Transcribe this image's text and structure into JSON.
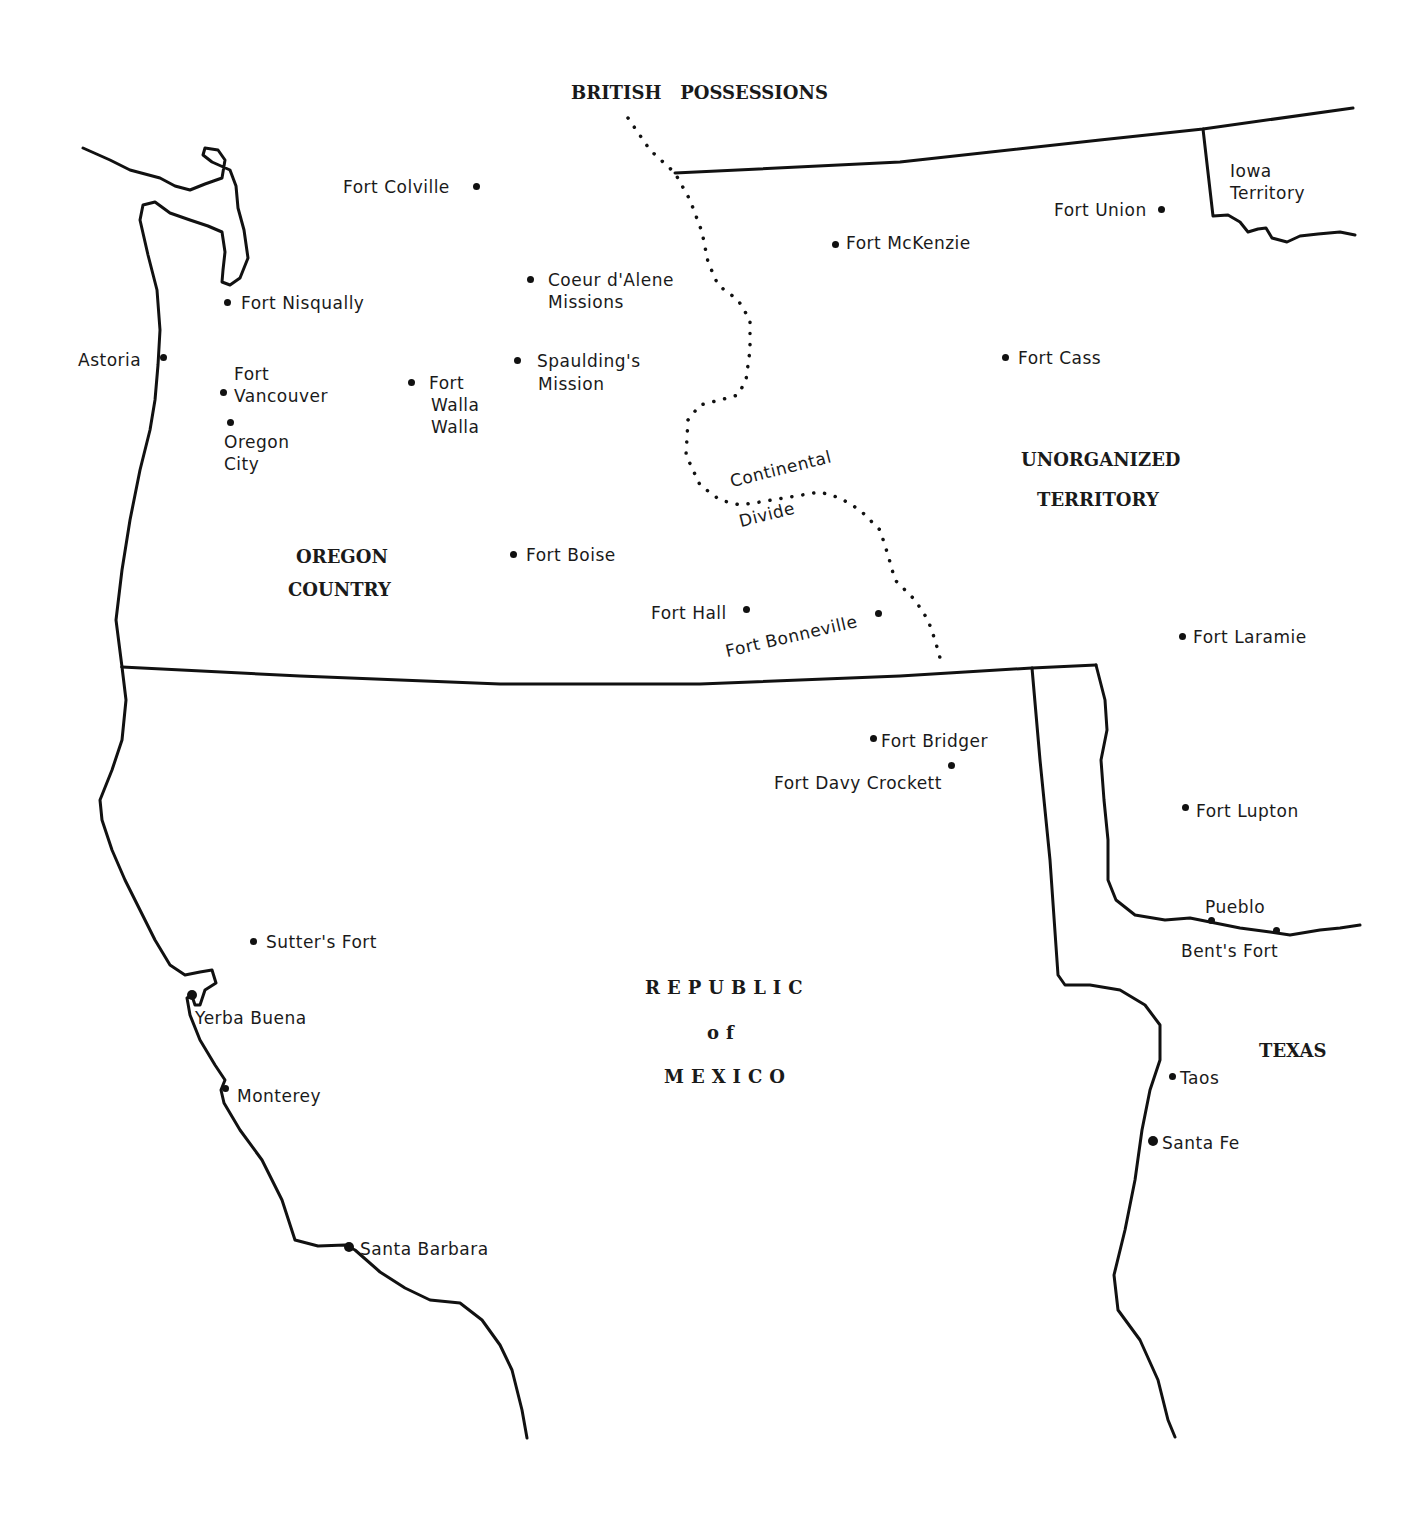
{
  "map": {
    "regions": {
      "british_possessions": "BRITISH   POSSESSIONS",
      "oregon_country_1": "OREGON",
      "oregon_country_2": "COUNTRY",
      "unorganized_1": "UNORGANIZED",
      "unorganized_2": "TERRITORY",
      "mexico_1": "REPUBLIC",
      "mexico_2": "of",
      "mexico_3": "MEXICO",
      "texas": "TEXAS",
      "iowa_1": "Iowa",
      "iowa_2": "Territory"
    },
    "features": {
      "continental_1": "Continental",
      "continental_2": "Divide"
    },
    "places": {
      "fort_colville": "Fort Colville",
      "fort_nisqually": "Fort Nisqually",
      "astoria": "Astoria",
      "fort_vancouver_1": "Fort",
      "fort_vancouver_2": "Vancouver",
      "oregon_city_1": "Oregon",
      "oregon_city_2": "City",
      "fort_walla_walla_1": "Fort",
      "fort_walla_walla_2": "Walla",
      "fort_walla_walla_3": "Walla",
      "coeur_dalene_1": "Coeur d'Alene",
      "coeur_dalene_2": "Missions",
      "spaulding_1": "Spaulding's",
      "spaulding_2": "Mission",
      "fort_boise": "Fort Boise",
      "fort_hall": "Fort Hall",
      "fort_bonneville": "Fort Bonneville",
      "fort_union": "Fort Union",
      "fort_mckenzie": "Fort McKenzie",
      "fort_cass": "Fort Cass",
      "fort_laramie": "Fort Laramie",
      "fort_bridger": "Fort Bridger",
      "fort_davy_crockett": "Fort Davy Crockett",
      "fort_lupton": "Fort Lupton",
      "pueblo": "Pueblo",
      "bents_fort": "Bent's Fort",
      "taos": "Taos",
      "santa_fe": "Santa Fe",
      "sutters_fort": "Sutter's Fort",
      "yerba_buena": "Yerba Buena",
      "monterey": "Monterey",
      "santa_barbara": "Santa Barbara"
    },
    "colors": {
      "ink": "#111111",
      "paper": "#ffffff"
    }
  }
}
